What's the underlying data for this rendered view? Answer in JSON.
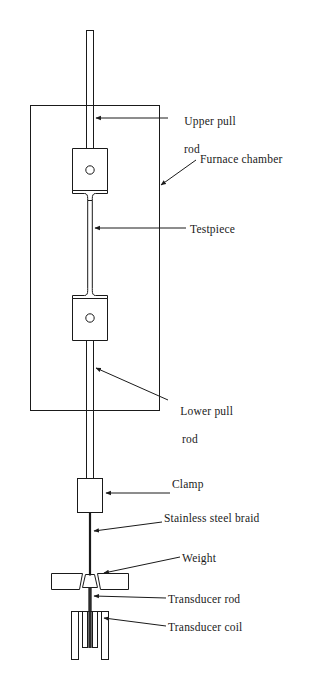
{
  "figure": {
    "background_color": "#ffffff",
    "line_color": "#1a1a1a",
    "text_color": "#1a1a1a"
  },
  "labels": {
    "upper_pull_rod_line1": "Upper pull",
    "upper_pull_rod_line2": "rod",
    "furnace_chamber": "Furnace chamber",
    "testpiece": "Testpiece",
    "lower_pull_rod_line1": "Lower pull",
    "lower_pull_rod_line2": "rod",
    "clamp": "Clamp",
    "stainless_steel_braid": "Stainless steel braid",
    "weight": "Weight",
    "transducer_rod": "Transducer rod",
    "transducer_coil": "Transducer coil"
  },
  "components": [
    {
      "name": "upper-pull-rod",
      "label": "Upper pull rod"
    },
    {
      "name": "furnace-chamber",
      "label": "Furnace chamber"
    },
    {
      "name": "upper-grip",
      "label": "Upper grip block"
    },
    {
      "name": "testpiece",
      "label": "Testpiece"
    },
    {
      "name": "lower-grip",
      "label": "Lower grip block"
    },
    {
      "name": "lower-pull-rod",
      "label": "Lower pull rod"
    },
    {
      "name": "clamp",
      "label": "Clamp"
    },
    {
      "name": "stainless-steel-braid",
      "label": "Stainless steel braid"
    },
    {
      "name": "weight",
      "label": "Weight"
    },
    {
      "name": "transducer-rod",
      "label": "Transducer rod"
    },
    {
      "name": "transducer-coil",
      "label": "Transducer coil"
    }
  ]
}
